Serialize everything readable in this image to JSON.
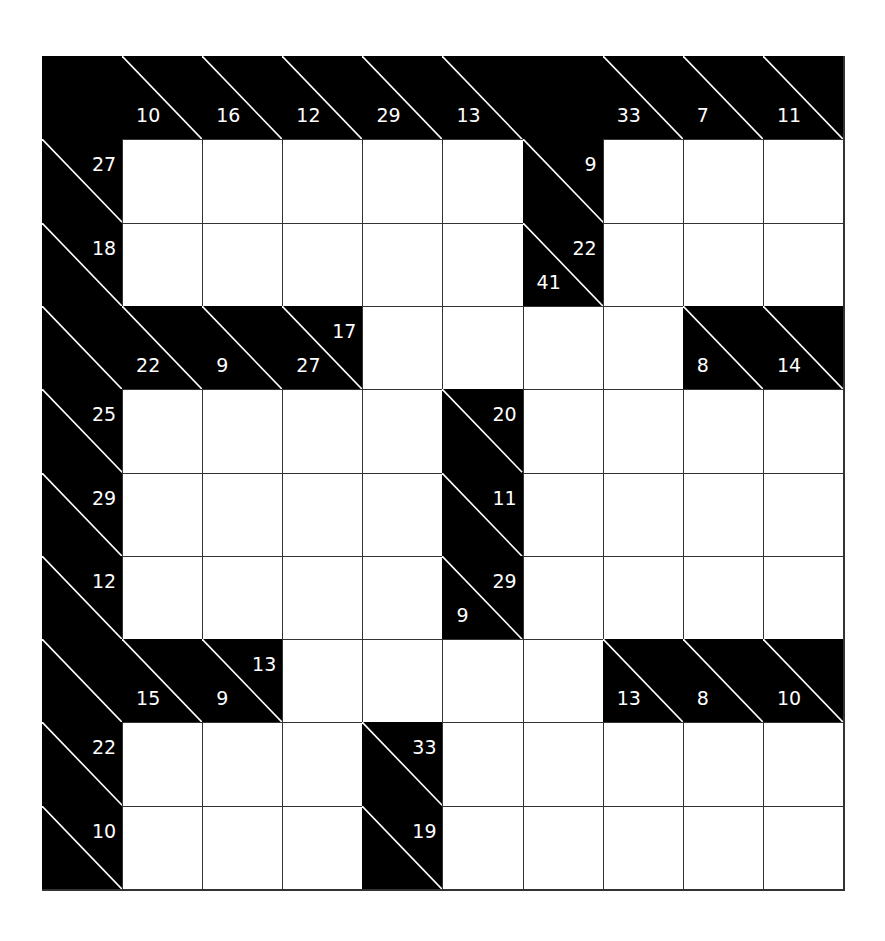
{
  "puzzle": {
    "type": "kakuro",
    "rows": 10,
    "cols": 10,
    "colors": {
      "clue_cell": "#000000",
      "entry_cell": "#ffffff",
      "clue_text": "#ffffff",
      "grid_line": "#333333"
    },
    "cells": [
      [
        {
          "t": "b"
        },
        {
          "t": "b",
          "down": "10",
          "diag": true
        },
        {
          "t": "b",
          "down": "16",
          "diag": true
        },
        {
          "t": "b",
          "down": "12",
          "diag": true
        },
        {
          "t": "b",
          "down": "29",
          "diag": true
        },
        {
          "t": "b",
          "down": "13",
          "diag": true
        },
        {
          "t": "b"
        },
        {
          "t": "b",
          "down": "33",
          "diag": true
        },
        {
          "t": "b",
          "down": "7",
          "diag": true
        },
        {
          "t": "b",
          "down": "11",
          "diag": true
        }
      ],
      [
        {
          "t": "b",
          "across": "27",
          "diag": true
        },
        {
          "t": "w"
        },
        {
          "t": "w"
        },
        {
          "t": "w"
        },
        {
          "t": "w"
        },
        {
          "t": "w"
        },
        {
          "t": "b",
          "across": "9",
          "diag": true
        },
        {
          "t": "w"
        },
        {
          "t": "w"
        },
        {
          "t": "w"
        }
      ],
      [
        {
          "t": "b",
          "across": "18",
          "diag": true
        },
        {
          "t": "w"
        },
        {
          "t": "w"
        },
        {
          "t": "w"
        },
        {
          "t": "w"
        },
        {
          "t": "w"
        },
        {
          "t": "b",
          "across": "22",
          "down": "41",
          "diag": true
        },
        {
          "t": "w"
        },
        {
          "t": "w"
        },
        {
          "t": "w"
        }
      ],
      [
        {
          "t": "b",
          "diag": true
        },
        {
          "t": "b",
          "down": "22",
          "diag": true
        },
        {
          "t": "b",
          "down": "9",
          "diag": true
        },
        {
          "t": "b",
          "across": "17",
          "down": "27",
          "diag": true
        },
        {
          "t": "w"
        },
        {
          "t": "w"
        },
        {
          "t": "w"
        },
        {
          "t": "w"
        },
        {
          "t": "b",
          "down": "8",
          "diag": true
        },
        {
          "t": "b",
          "down": "14",
          "diag": true
        }
      ],
      [
        {
          "t": "b",
          "across": "25",
          "diag": true
        },
        {
          "t": "w"
        },
        {
          "t": "w"
        },
        {
          "t": "w"
        },
        {
          "t": "w"
        },
        {
          "t": "b",
          "across": "20",
          "diag": true
        },
        {
          "t": "w"
        },
        {
          "t": "w"
        },
        {
          "t": "w"
        },
        {
          "t": "w"
        }
      ],
      [
        {
          "t": "b",
          "across": "29",
          "diag": true
        },
        {
          "t": "w"
        },
        {
          "t": "w"
        },
        {
          "t": "w"
        },
        {
          "t": "w"
        },
        {
          "t": "b",
          "across": "11",
          "diag": true
        },
        {
          "t": "w"
        },
        {
          "t": "w"
        },
        {
          "t": "w"
        },
        {
          "t": "w"
        }
      ],
      [
        {
          "t": "b",
          "across": "12",
          "diag": true
        },
        {
          "t": "w"
        },
        {
          "t": "w"
        },
        {
          "t": "w"
        },
        {
          "t": "w"
        },
        {
          "t": "b",
          "across": "29",
          "down": "9",
          "diag": true
        },
        {
          "t": "w"
        },
        {
          "t": "w"
        },
        {
          "t": "w"
        },
        {
          "t": "w"
        }
      ],
      [
        {
          "t": "b",
          "diag": true
        },
        {
          "t": "b",
          "down": "15",
          "diag": true
        },
        {
          "t": "b",
          "across": "13",
          "down": "9",
          "diag": true
        },
        {
          "t": "w"
        },
        {
          "t": "w"
        },
        {
          "t": "w"
        },
        {
          "t": "w"
        },
        {
          "t": "b",
          "down": "13",
          "diag": true
        },
        {
          "t": "b",
          "down": "8",
          "diag": true
        },
        {
          "t": "b",
          "down": "10",
          "diag": true
        }
      ],
      [
        {
          "t": "b",
          "across": "22",
          "diag": true
        },
        {
          "t": "w"
        },
        {
          "t": "w"
        },
        {
          "t": "w"
        },
        {
          "t": "b",
          "across": "33",
          "diag": true
        },
        {
          "t": "w"
        },
        {
          "t": "w"
        },
        {
          "t": "w"
        },
        {
          "t": "w"
        },
        {
          "t": "w"
        }
      ],
      [
        {
          "t": "b",
          "across": "10",
          "diag": true
        },
        {
          "t": "w"
        },
        {
          "t": "w"
        },
        {
          "t": "w"
        },
        {
          "t": "b",
          "across": "19",
          "diag": true
        },
        {
          "t": "w"
        },
        {
          "t": "w"
        },
        {
          "t": "w"
        },
        {
          "t": "w"
        },
        {
          "t": "w"
        }
      ]
    ]
  }
}
